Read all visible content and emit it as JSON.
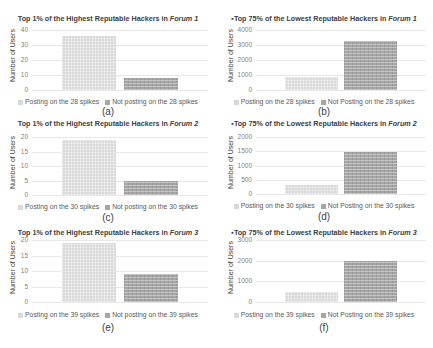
{
  "chart_data": [
    {
      "id": "a",
      "type": "bar",
      "title": "Top 1% of the Highest Reputable Hackers in Forum 1",
      "title_prefix": "Top 1% of the Highest Reputable Hackers in ",
      "title_forum": "Forum 1",
      "ylabel": "Number of Users",
      "xlabel": "",
      "ylim": [
        0,
        40
      ],
      "yticks": [
        0,
        10,
        20,
        30,
        40
      ],
      "grid": true,
      "legend_position": "bottom",
      "categories": [
        "Posting on the 28 spikes",
        "Not posting on the 28 spikes"
      ],
      "values": [
        36,
        8
      ],
      "caption": "(a)"
    },
    {
      "id": "b",
      "type": "bar",
      "title": "Top 75% of the Lowest Reputable Hackers in Forum 1",
      "title_prefix": "▪Top 75% of the Lowest Reputable Hackers in ",
      "title_forum": "Forum 1",
      "ylabel": "Number of Users",
      "xlabel": "",
      "ylim": [
        0,
        4000
      ],
      "yticks": [
        0,
        1000,
        2000,
        3000,
        4000
      ],
      "grid": true,
      "legend_position": "bottom",
      "categories": [
        "Posting on the 28 spikes",
        "Not Posting on the 28 spikes"
      ],
      "values": [
        900,
        3250
      ],
      "caption": "(b)"
    },
    {
      "id": "c",
      "type": "bar",
      "title": "Top 1% of the Highest Reputable Hackers in Forum 2",
      "title_prefix": "Top 1% of the Highest Reputable Hackers in ",
      "title_forum": "Forum 2",
      "ylabel": "Number of Users",
      "xlabel": "",
      "ylim": [
        0,
        20
      ],
      "yticks": [
        0,
        5,
        10,
        15,
        20
      ],
      "grid": true,
      "legend_position": "bottom",
      "categories": [
        "Posting on the 30 spikes",
        "Not posting on the 30 spikes"
      ],
      "values": [
        19,
        5
      ],
      "caption": "(c)"
    },
    {
      "id": "d",
      "type": "bar",
      "title": "Top 75% of the Lowest Reputable Hackers in Forum 2",
      "title_prefix": "▪Top 75% of the Lowest Reputable Hackers in ",
      "title_forum": "Forum 2",
      "ylabel": "Number of Users",
      "xlabel": "",
      "ylim": [
        0,
        2000
      ],
      "yticks": [
        0,
        500,
        1000,
        1500,
        2000
      ],
      "grid": true,
      "legend_position": "bottom",
      "categories": [
        "Posting on the 30 spikes",
        "Not Posting on the 30 spikes"
      ],
      "values": [
        330,
        1480
      ],
      "caption": "(d)"
    },
    {
      "id": "e",
      "type": "bar",
      "title": "Top 1% of the Highest Reputable Hackers in Forum 3",
      "title_prefix": "Top 1% of the Highest Reputable Hackers in ",
      "title_forum": "Forum 3",
      "ylabel": "Number of Users",
      "xlabel": "",
      "ylim": [
        0,
        20
      ],
      "yticks": [
        0,
        5,
        10,
        15,
        20
      ],
      "grid": true,
      "legend_position": "bottom",
      "categories": [
        "Posting on the 39 spikes",
        "Not posting on the 39 spikes"
      ],
      "values": [
        19,
        9
      ],
      "caption": "(e)"
    },
    {
      "id": "f",
      "type": "bar",
      "title": "Top 75% of the Lowest Reputable Hackers in Forum 3",
      "title_prefix": "▪Top 75% of the Lowest Reputable Hackers in ",
      "title_forum": "Forum 3",
      "ylabel": "Number of Users",
      "xlabel": "",
      "ylim": [
        0,
        3000
      ],
      "yticks": [
        0,
        1000,
        2000,
        3000
      ],
      "grid": true,
      "legend_position": "bottom",
      "categories": [
        "Posting on the 39 spikes",
        "Not Posting on the 39 spikes"
      ],
      "values": [
        480,
        2000
      ],
      "caption": "(f)"
    }
  ],
  "colors": {
    "series_light": "#d9d9d9",
    "series_dark": "#a6a6a6",
    "grid": "#e8e8e8",
    "text": "#595959"
  }
}
